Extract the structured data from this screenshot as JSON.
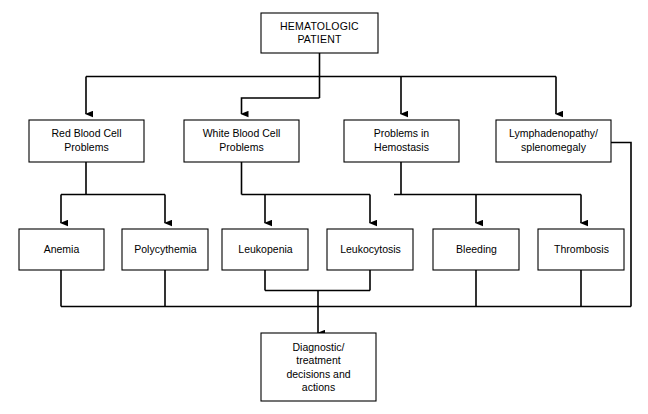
{
  "diagram": {
    "colors": {
      "background": "#ffffff",
      "stroke": "#000000",
      "node_fill": "#ffffff",
      "text": "#000000"
    },
    "nodes": {
      "root": {
        "id": "hematologic-patient",
        "lines": [
          "HEMATOLOGIC",
          "PATIENT"
        ],
        "line1": "HEMATOLOGIC",
        "line2": "PATIENT"
      },
      "level2": [
        {
          "id": "red-blood-cell-problems",
          "line1": "Red Blood Cell",
          "line2": "Problems"
        },
        {
          "id": "white-blood-cell-problems",
          "line1": "White Blood Cell",
          "line2": "Problems"
        },
        {
          "id": "problems-in-hemostasis",
          "line1": "Problems in",
          "line2": "Hemostasis"
        },
        {
          "id": "lymphadenopathy-splenomegaly",
          "line1": "Lymphadenopathy/",
          "line2": "splenomegaly"
        }
      ],
      "level3": [
        {
          "id": "anemia",
          "label": "Anemia"
        },
        {
          "id": "polycythemia",
          "label": "Polycythemia"
        },
        {
          "id": "leukopenia",
          "label": "Leukopenia"
        },
        {
          "id": "leukocytosis",
          "label": "Leukocytosis"
        },
        {
          "id": "bleeding",
          "label": "Bleeding"
        },
        {
          "id": "thrombosis",
          "label": "Thrombosis"
        }
      ],
      "outcome": {
        "id": "diagnostic-treatment-decisions-and-actions",
        "line1": "Diagnostic/",
        "line2": "treatment",
        "line3": "decisions and",
        "line4": "actions"
      }
    },
    "edges": [
      {
        "from": "hematologic-patient",
        "to": "red-blood-cell-problems"
      },
      {
        "from": "hematologic-patient",
        "to": "white-blood-cell-problems"
      },
      {
        "from": "hematologic-patient",
        "to": "problems-in-hemostasis"
      },
      {
        "from": "hematologic-patient",
        "to": "lymphadenopathy-splenomegaly"
      },
      {
        "from": "red-blood-cell-problems",
        "to": "anemia"
      },
      {
        "from": "red-blood-cell-problems",
        "to": "polycythemia"
      },
      {
        "from": "white-blood-cell-problems",
        "to": "leukopenia"
      },
      {
        "from": "white-blood-cell-problems",
        "to": "leukocytosis"
      },
      {
        "from": "problems-in-hemostasis",
        "to": "bleeding"
      },
      {
        "from": "problems-in-hemostasis",
        "to": "thrombosis"
      },
      {
        "from": "lymphadenopathy-splenomegaly",
        "to": "diagnostic-treatment-decisions-and-actions"
      },
      {
        "from": "anemia",
        "to": "diagnostic-treatment-decisions-and-actions"
      },
      {
        "from": "polycythemia",
        "to": "diagnostic-treatment-decisions-and-actions"
      },
      {
        "from": "leukopenia",
        "to": "diagnostic-treatment-decisions-and-actions"
      },
      {
        "from": "leukocytosis",
        "to": "diagnostic-treatment-decisions-and-actions"
      },
      {
        "from": "bleeding",
        "to": "diagnostic-treatment-decisions-and-actions"
      },
      {
        "from": "thrombosis",
        "to": "diagnostic-treatment-decisions-and-actions"
      }
    ]
  }
}
